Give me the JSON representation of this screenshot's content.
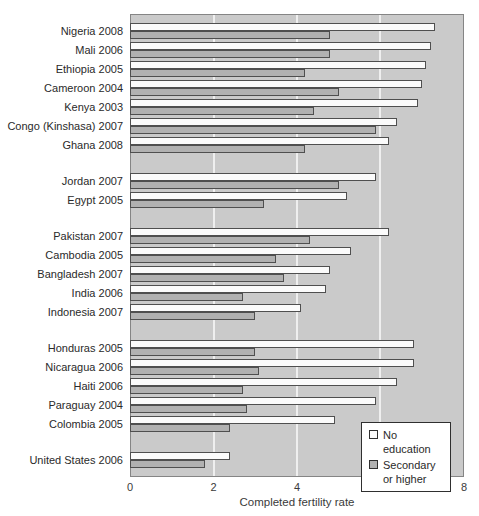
{
  "chart_data": {
    "type": "bar",
    "orientation": "horizontal",
    "title": "",
    "x_axis": {
      "label": "Completed fertility rate",
      "min": 0,
      "max": 8,
      "ticks": [
        0,
        2,
        4,
        6,
        8
      ]
    },
    "grid": "vertical white lines at 2, 4, 6",
    "legend_position": "bottom-right inside plot",
    "series": [
      {
        "name": "No education",
        "fill": "#fbfbfb"
      },
      {
        "name": "Secondary or higher",
        "fill": "#b1b1b1"
      }
    ],
    "groups": [
      [
        {
          "label": "Nigeria 2008",
          "values": [
            7.3,
            4.8
          ]
        },
        {
          "label": "Mali 2006",
          "values": [
            7.2,
            4.8
          ]
        },
        {
          "label": "Ethiopia 2005",
          "values": [
            7.1,
            4.2
          ]
        },
        {
          "label": "Cameroon 2004",
          "values": [
            7.0,
            5.0
          ]
        },
        {
          "label": "Kenya 2003",
          "values": [
            6.9,
            4.4
          ]
        },
        {
          "label": "Congo (Kinshasa) 2007",
          "values": [
            6.4,
            5.9
          ]
        },
        {
          "label": "Ghana 2008",
          "values": [
            6.2,
            4.2
          ]
        }
      ],
      [
        {
          "label": "Jordan 2007",
          "values": [
            5.9,
            5.0
          ]
        },
        {
          "label": "Egypt 2005",
          "values": [
            5.2,
            3.2
          ]
        }
      ],
      [
        {
          "label": "Pakistan 2007",
          "values": [
            6.2,
            4.3
          ]
        },
        {
          "label": "Cambodia 2005",
          "values": [
            5.3,
            3.5
          ]
        },
        {
          "label": "Bangladesh 2007",
          "values": [
            4.8,
            3.7
          ]
        },
        {
          "label": "India 2006",
          "values": [
            4.7,
            2.7
          ]
        },
        {
          "label": "Indonesia 2007",
          "values": [
            4.1,
            3.0
          ]
        }
      ],
      [
        {
          "label": "Honduras 2005",
          "values": [
            6.8,
            3.0
          ]
        },
        {
          "label": "Nicaragua 2006",
          "values": [
            6.8,
            3.1
          ]
        },
        {
          "label": "Haiti 2006",
          "values": [
            6.4,
            2.7
          ]
        },
        {
          "label": "Paraguay 2004",
          "values": [
            5.9,
            2.8
          ]
        },
        {
          "label": "Colombia 2005",
          "values": [
            4.9,
            2.4
          ]
        }
      ],
      [
        {
          "label": "United States 2006",
          "values": [
            2.4,
            1.8
          ]
        }
      ]
    ]
  },
  "colors": {
    "plot_background": "#cacaca",
    "gridline": "#efefef",
    "bar_border": "#4f4f4f",
    "no_education_fill": "#fbfbfb",
    "secondary_or_higher_fill": "#b1b1b1",
    "text": "#2a2a2a"
  }
}
